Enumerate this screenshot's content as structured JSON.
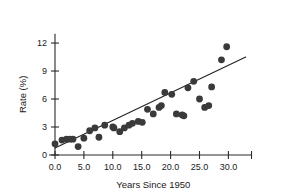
{
  "chart_data": {
    "type": "scatter",
    "title": "",
    "xlabel": "Years Since 1950",
    "ylabel": "Rate (%)",
    "xlim": [
      -1.0,
      34.0
    ],
    "ylim": [
      -0.4,
      13.0
    ],
    "xticks": [
      0.0,
      5.0,
      10.0,
      15.0,
      20.0,
      25.0,
      30.0
    ],
    "xtick_labels": [
      "0.0",
      "5.0",
      "10.0",
      "15.0",
      "20.0",
      "25.0",
      "30.0"
    ],
    "yticks": [
      0,
      3,
      6,
      9,
      12
    ],
    "ytick_labels": [
      "0",
      "3",
      "6",
      "9",
      "12"
    ],
    "grid": false,
    "legend": false,
    "marker": "filled-circle",
    "marker_color": "#3a3a3a",
    "marker_size": 3.4,
    "points": [
      {
        "x": 0.0,
        "y": 1.2
      },
      {
        "x": 1.2,
        "y": 1.6
      },
      {
        "x": 2.0,
        "y": 1.7
      },
      {
        "x": 2.6,
        "y": 1.7
      },
      {
        "x": 3.1,
        "y": 1.7
      },
      {
        "x": 4.0,
        "y": 0.9
      },
      {
        "x": 5.0,
        "y": 1.8
      },
      {
        "x": 6.0,
        "y": 2.6
      },
      {
        "x": 6.9,
        "y": 2.9
      },
      {
        "x": 7.6,
        "y": 1.9
      },
      {
        "x": 8.6,
        "y": 3.2
      },
      {
        "x": 10.0,
        "y": 3.0
      },
      {
        "x": 10.2,
        "y": 2.9
      },
      {
        "x": 11.2,
        "y": 2.5
      },
      {
        "x": 12.0,
        "y": 2.9
      },
      {
        "x": 12.8,
        "y": 3.2
      },
      {
        "x": 13.4,
        "y": 3.4
      },
      {
        "x": 14.4,
        "y": 3.6
      },
      {
        "x": 15.1,
        "y": 3.5
      },
      {
        "x": 16.0,
        "y": 4.9
      },
      {
        "x": 17.0,
        "y": 4.4
      },
      {
        "x": 18.0,
        "y": 5.1
      },
      {
        "x": 18.4,
        "y": 5.3
      },
      {
        "x": 19.0,
        "y": 6.7
      },
      {
        "x": 20.2,
        "y": 6.5
      },
      {
        "x": 21.0,
        "y": 4.4
      },
      {
        "x": 22.0,
        "y": 4.3
      },
      {
        "x": 22.3,
        "y": 4.2
      },
      {
        "x": 23.0,
        "y": 7.2
      },
      {
        "x": 24.0,
        "y": 7.9
      },
      {
        "x": 25.0,
        "y": 6.0
      },
      {
        "x": 25.9,
        "y": 5.1
      },
      {
        "x": 26.6,
        "y": 5.3
      },
      {
        "x": 27.1,
        "y": 7.3
      },
      {
        "x": 28.8,
        "y": 10.2
      },
      {
        "x": 29.7,
        "y": 11.6
      }
    ],
    "trend_line": {
      "type": "linear-fit",
      "x_start": 0.0,
      "y_start": 0.75,
      "x_end": 33.0,
      "y_end": 10.5,
      "color": "#232323"
    }
  }
}
